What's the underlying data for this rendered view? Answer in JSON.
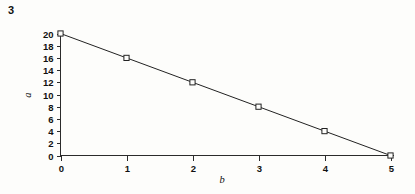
{
  "figure": {
    "number": "3"
  },
  "chart_data": {
    "type": "line",
    "title": "",
    "subtitle": "",
    "xlabel": "b",
    "ylabel": "a",
    "x": [
      0,
      1,
      2,
      3,
      4,
      5
    ],
    "values": [
      20,
      16,
      12,
      8,
      4,
      0
    ],
    "series": [
      {
        "name": "a vs b",
        "x": [
          0,
          1,
          2,
          3,
          4,
          5
        ],
        "values": [
          20,
          16,
          12,
          8,
          4,
          0
        ]
      }
    ],
    "xlim": [
      0,
      5
    ],
    "ylim": [
      0,
      20
    ],
    "xticks": [
      "0",
      "1",
      "2",
      "3",
      "4",
      "5"
    ],
    "yticks": [
      "0",
      "2",
      "4",
      "6",
      "8",
      "10",
      "12",
      "14",
      "16",
      "18",
      "20"
    ],
    "xtick_values": [
      0,
      1,
      2,
      3,
      4,
      5
    ],
    "ytick_values": [
      0,
      2,
      4,
      6,
      8,
      10,
      12,
      14,
      16,
      18,
      20
    ],
    "grid": false,
    "legend": false,
    "marker": "open-square",
    "line_color": "#222222",
    "marker_fill": "#fdfdfb",
    "axis_color": "#2b2b2b",
    "relationship": "a = 20 - 4b",
    "annotations": []
  }
}
